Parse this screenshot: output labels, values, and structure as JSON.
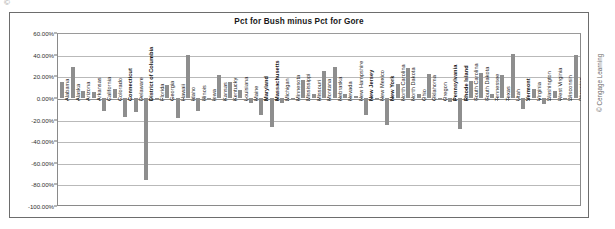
{
  "caption": {
    "mark": "©",
    "text": ""
  },
  "chart": {
    "title": "Pct for Bush minus Pct for Gore",
    "copyright": "© Cengage Learning",
    "bar_color": "#8e8e8e",
    "grid_color": "#b9b9b9",
    "frame_color": "#6d6d6d",
    "y_tick_labels": [
      "60.00%",
      "40.00%",
      "20.00%",
      "0.00%",
      "-20.00%",
      "-40.00%",
      "-60.00%",
      "-80.00%",
      "-100.00%"
    ]
  },
  "chart_data": {
    "type": "bar",
    "title": "Pct for Bush minus Pct for Gore",
    "xlabel": "",
    "ylabel": "",
    "ylim": [
      -100,
      60
    ],
    "ytick_step": 20,
    "ytick_format": "percent",
    "grid": true,
    "legend": "none",
    "orientation": "vertical",
    "categories": [
      "Alabama",
      "Alaska",
      "Arizona",
      "Arkansas",
      "California",
      "Colorado",
      "Connecticut",
      "Delaware",
      "District of Columbia",
      "Florida",
      "Georgia",
      "Hawaii",
      "Idaho",
      "Illinois",
      "Iowa",
      "Kansas",
      "Kentucky",
      "Louisiana",
      "Maine",
      "Maryland",
      "Massachusetts",
      "Michigan",
      "Minnesota",
      "Mississippi",
      "Missouri",
      "Montana",
      "Nebraska",
      "Nevada",
      "New Hampshire",
      "New Jersey",
      "New Mexico",
      "New York",
      "North Carolina",
      "North Dakota",
      "Ohio",
      "Oklahoma",
      "Oregon",
      "Pennsylvania",
      "Rhode Island",
      "South Carolina",
      "South Dakota",
      "Tennessee",
      "Texas",
      "Utah",
      "Vermont",
      "Virginia",
      "Washington",
      "West Virginia",
      "Wisconsin",
      "Wyoming"
    ],
    "values": [
      14.9,
      29.0,
      6.3,
      5.4,
      -11.8,
      8.4,
      -17.5,
      -13.1,
      -76.2,
      0.0,
      11.7,
      -18.3,
      39.5,
      -12.0,
      -0.3,
      20.8,
      15.1,
      7.7,
      -5.1,
      -16.2,
      -27.3,
      -5.2,
      -2.4,
      16.9,
      3.3,
      25.0,
      29.0,
      3.5,
      1.3,
      -15.8,
      -0.1,
      -25.0,
      12.8,
      27.6,
      3.6,
      21.9,
      -0.4,
      -4.2,
      -29.1,
      15.9,
      22.7,
      3.6,
      21.3,
      40.5,
      -9.9,
      8.0,
      -5.6,
      6.3,
      -0.2,
      40.1
    ]
  }
}
